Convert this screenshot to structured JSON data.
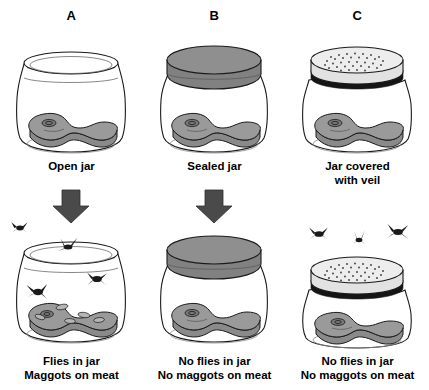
{
  "figure": {
    "background_color": "#ffffff",
    "ink_color": "#1a1a1a",
    "meat_color": "#9a9a9a",
    "lid_color": "#8f8f8f",
    "veil_color": "#ededed",
    "arrow_color": "#4a4a4a"
  },
  "columns": [
    {
      "letter": "A",
      "setup_caption": "Open jar",
      "result_caption_line1": "Flies in jar",
      "result_caption_line2": "Maggots on meat",
      "closure": "open",
      "flies_count": 4,
      "maggots_count": 5,
      "has_arrow": true
    },
    {
      "letter": "B",
      "setup_caption": "Sealed jar",
      "result_caption_line1": "No flies in jar",
      "result_caption_line2": "No maggots on meat",
      "closure": "sealed-lid",
      "flies_count": 0,
      "maggots_count": 0,
      "has_arrow": true
    },
    {
      "letter": "C",
      "setup_caption_line1": "Jar covered",
      "setup_caption_line2": "with veil",
      "result_caption_line1": "No flies in jar",
      "result_caption_line2": "No maggots on meat",
      "closure": "veil",
      "flies_count": 3,
      "maggots_count": 0,
      "has_arrow": false
    }
  ]
}
